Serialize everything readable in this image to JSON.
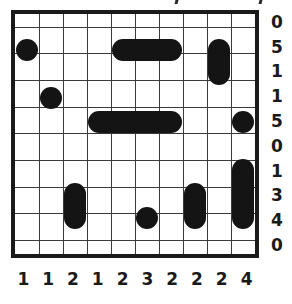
{
  "puzzle": {
    "type": "nonogram-grid",
    "rows": 10,
    "columns": 10,
    "grid_color": "#3a3a3a",
    "frame_color": "#1a1a1a",
    "fill_color": "#141414",
    "background_color": "#ffffff",
    "row_clues": [
      "0",
      "5",
      "1",
      "1",
      "5",
      "0",
      "1",
      "3",
      "4",
      "0"
    ],
    "column_clues": [
      "1",
      "1",
      "2",
      "1",
      "2",
      "3",
      "2",
      "2",
      "2",
      "4"
    ],
    "filled_runs": [
      {
        "row": 2,
        "col_start": 1,
        "col_end": 1
      },
      {
        "row": 2,
        "col_start": 5,
        "col_end": 7
      },
      {
        "row": 2,
        "col_start": 9,
        "col_end": 9
      },
      {
        "row": 3,
        "col_start": 9,
        "col_end": 9
      },
      {
        "row": 4,
        "col_start": 2,
        "col_end": 2
      },
      {
        "row": 5,
        "col_start": 4,
        "col_end": 7
      },
      {
        "row": 5,
        "col_start": 10,
        "col_end": 10
      },
      {
        "row": 7,
        "col_start": 10,
        "col_end": 10
      },
      {
        "row": 8,
        "col_start": 3,
        "col_end": 3
      },
      {
        "row": 8,
        "col_start": 8,
        "col_end": 8
      },
      {
        "row": 8,
        "col_start": 10,
        "col_end": 10
      },
      {
        "row": 9,
        "col_start": 3,
        "col_end": 3
      },
      {
        "row": 9,
        "col_start": 6,
        "col_end": 6
      },
      {
        "row": 9,
        "col_start": 8,
        "col_end": 8
      },
      {
        "row": 9,
        "col_start": 10,
        "col_end": 10
      }
    ],
    "merged_blobs": [
      {
        "name": "blob-r2-c1",
        "row_start": 2,
        "row_end": 2,
        "col_start": 1,
        "col_end": 1
      },
      {
        "name": "blob-r2-c5c7",
        "row_start": 2,
        "row_end": 2,
        "col_start": 5,
        "col_end": 7
      },
      {
        "name": "blob-r2r3-c9",
        "row_start": 2,
        "row_end": 3,
        "col_start": 9,
        "col_end": 9
      },
      {
        "name": "blob-r4-c2",
        "row_start": 4,
        "row_end": 4,
        "col_start": 2,
        "col_end": 2
      },
      {
        "name": "blob-r5-c4c7",
        "row_start": 5,
        "row_end": 5,
        "col_start": 4,
        "col_end": 7
      },
      {
        "name": "blob-r5-c10",
        "row_start": 5,
        "row_end": 5,
        "col_start": 10,
        "col_end": 10
      },
      {
        "name": "blob-r7r9-c10",
        "row_start": 7,
        "row_end": 9,
        "col_start": 10,
        "col_end": 10
      },
      {
        "name": "blob-r8r9-c3",
        "row_start": 8,
        "row_end": 9,
        "col_start": 3,
        "col_end": 3
      },
      {
        "name": "blob-r8r9-c8",
        "row_start": 8,
        "row_end": 9,
        "col_start": 8,
        "col_end": 8
      },
      {
        "name": "blob-r9-c6",
        "row_start": 9,
        "row_end": 9,
        "col_start": 6,
        "col_end": 6
      }
    ]
  }
}
